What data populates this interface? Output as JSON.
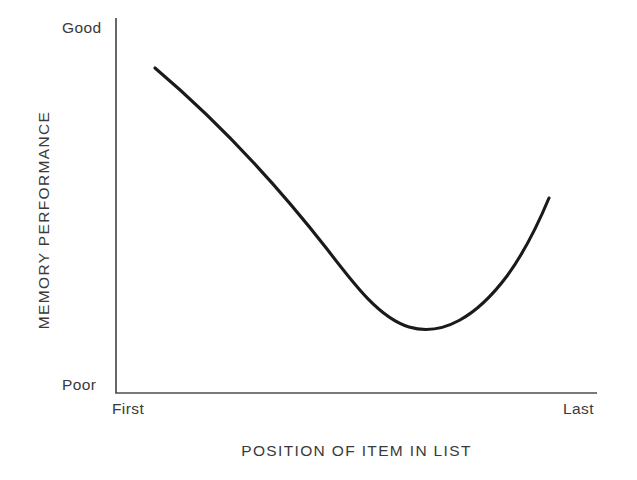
{
  "figure": {
    "background_color": "#ffffff",
    "ink_color": "#1a1a1a",
    "axis_color": "#4a4a4a"
  },
  "axes": {
    "y_title": "MEMORY PERFORMANCE",
    "x_title": "POSITION OF ITEM IN LIST",
    "y_tick_high": "Good",
    "y_tick_low": "Poor",
    "x_tick_first": "First",
    "x_tick_last": "Last"
  },
  "chart_data": {
    "type": "line",
    "title": "",
    "subtitle": "",
    "xlabel": "POSITION OF ITEM IN LIST",
    "ylabel": "MEMORY PERFORMANCE",
    "xticklabels": [
      "First",
      "Last"
    ],
    "yticklabels": [
      "Poor",
      "Good"
    ],
    "xlim": [
      0,
      1
    ],
    "ylim": [
      0,
      1
    ],
    "grid": false,
    "legend": "none",
    "annotations": [],
    "series": [
      {
        "name": "serial position curve",
        "line_color": "#1a1a1a",
        "line_width": 3,
        "x": [
          0.08,
          0.14,
          0.21,
          0.28,
          0.35,
          0.42,
          0.49,
          0.56,
          0.61,
          0.66,
          0.72,
          0.78,
          0.84,
          0.9
        ],
        "y": [
          0.866,
          0.793,
          0.706,
          0.62,
          0.535,
          0.452,
          0.371,
          0.296,
          0.25,
          0.222,
          0.207,
          0.248,
          0.356,
          0.52
        ]
      }
    ]
  },
  "curve_geometry": {
    "path": "M 155 68 C 214 118 273 180 327 249 C 356 287 380 318 409 327 C 443 337 477 316 507 276 C 526 250 539 222 549 198",
    "stroke": "#1a1a1a",
    "stroke_width": 3.1
  },
  "axis_geometry": {
    "y_axis": {
      "x": 116,
      "y_top": 18,
      "y_bottom": 393
    },
    "x_axis": {
      "y": 393,
      "x_left": 116,
      "x_right": 597
    },
    "stroke": "#4d4d4d",
    "stroke_width": 1.7
  }
}
